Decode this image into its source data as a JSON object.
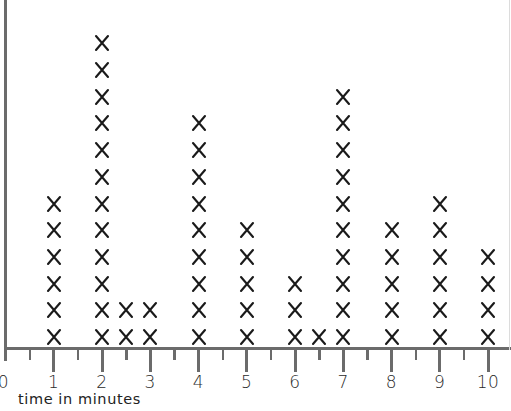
{
  "chart_data": {
    "type": "dot_plot",
    "title": "",
    "xlabel": "time in minutes",
    "ylabel": "",
    "marker": "X",
    "xlim": [
      0,
      10
    ],
    "major_ticks": [
      0,
      1,
      2,
      3,
      4,
      5,
      6,
      7,
      8,
      9,
      10
    ],
    "minor_ticks": [
      0.5,
      1.5,
      2.5,
      3.5,
      4.5,
      5.5,
      6.5,
      7.5,
      8.5,
      9.5
    ],
    "tick_labels": [
      "0",
      "1",
      "2",
      "3",
      "4",
      "5",
      "6",
      "7",
      "8",
      "9",
      "10"
    ],
    "grid": false,
    "legend": null,
    "points": [
      {
        "x": 1,
        "count": 6
      },
      {
        "x": 2,
        "count": 12
      },
      {
        "x": 2.5,
        "count": 2
      },
      {
        "x": 3,
        "count": 2
      },
      {
        "x": 4,
        "count": 9
      },
      {
        "x": 5,
        "count": 5
      },
      {
        "x": 6,
        "count": 3
      },
      {
        "x": 6.5,
        "count": 1
      },
      {
        "x": 7,
        "count": 10
      },
      {
        "x": 8,
        "count": 5
      },
      {
        "x": 9,
        "count": 6
      },
      {
        "x": 10,
        "count": 4
      }
    ],
    "total_observations": 65
  },
  "colors": {
    "axis": "#6b6b6b",
    "marker": "#1a1a1a",
    "background": "#ffffff"
  }
}
